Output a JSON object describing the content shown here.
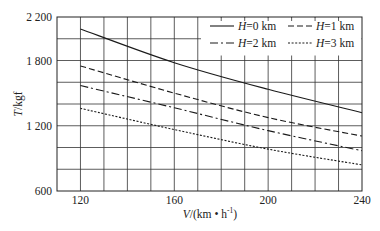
{
  "chart_data": {
    "type": "line",
    "title": "",
    "xlabel": "V/(km • h⁻¹)",
    "xlabel_parts": {
      "var": "V",
      "unit": "/(km • h",
      "sup": "-1",
      "close": ")"
    },
    "ylabel": "T/kgf",
    "ylabel_parts": {
      "var": "T",
      "unit": "/kgf"
    },
    "xlim": [
      110,
      240
    ],
    "ylim": [
      600,
      2200
    ],
    "x_ticks": [
      120,
      160,
      200,
      240
    ],
    "x_tick_labels": [
      "120",
      "160",
      "200",
      "240"
    ],
    "y_ticks": [
      600,
      1200,
      1800,
      2200
    ],
    "y_tick_labels": [
      "600",
      "1 200",
      "1 800",
      "2 200"
    ],
    "x_grid_step": 10,
    "y_grid_step": 200,
    "grid": true,
    "legend_position": "upper right",
    "x": [
      120,
      160,
      200,
      240
    ],
    "series": [
      {
        "name": "H=0 km",
        "var": "H",
        "label": "=0 km",
        "style": "solid",
        "values": [
          2090,
          1780,
          1535,
          1320
        ]
      },
      {
        "name": "H=1 km",
        "var": "H",
        "label": "=1 km",
        "style": "dashed",
        "values": [
          1750,
          1500,
          1275,
          1105
        ]
      },
      {
        "name": "H=2 km",
        "var": "H",
        "label": "=2 km",
        "style": "dashdot",
        "values": [
          1570,
          1365,
          1155,
          970
        ]
      },
      {
        "name": "H=3 km",
        "var": "H",
        "label": "=3 km",
        "style": "dotted",
        "values": [
          1360,
          1165,
          985,
          840
        ]
      }
    ]
  },
  "colors": {
    "line": "#1a1a1a",
    "grid": "#333333",
    "background": "#ffffff"
  }
}
